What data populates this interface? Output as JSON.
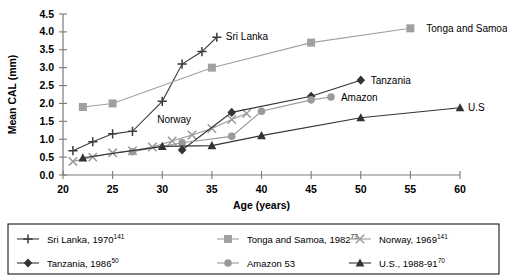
{
  "chart_data": {
    "type": "line",
    "title": "",
    "xlabel": "Age (years)",
    "ylabel": "Mean CAL (mm)",
    "xlim": [
      20,
      60
    ],
    "ylim": [
      0.0,
      4.5
    ],
    "xticks": [
      20,
      25,
      30,
      35,
      40,
      45,
      50,
      55,
      60
    ],
    "yticks": [
      "0.0",
      "0.5",
      "1.0",
      "1.5",
      "2.0",
      "2.5",
      "3.0",
      "3.5",
      "4.0",
      "4.5"
    ],
    "grid": false,
    "legend_position": "bottom",
    "series": [
      {
        "name": "Sri Lanka",
        "legend_label": "Sri Lanka, 1970",
        "legend_superscript": "141",
        "marker": "plus",
        "color": "#3b3b3b",
        "inline_label": "Sri Lanka",
        "inline_label_x": 35.6,
        "inline_label_y": 3.87,
        "points": [
          {
            "x": 21,
            "y": 0.68
          },
          {
            "x": 23,
            "y": 0.93
          },
          {
            "x": 25,
            "y": 1.15
          },
          {
            "x": 27,
            "y": 1.22
          },
          {
            "x": 30,
            "y": 2.06
          },
          {
            "x": 32,
            "y": 3.1
          },
          {
            "x": 34,
            "y": 3.45
          },
          {
            "x": 35.5,
            "y": 3.85
          }
        ]
      },
      {
        "name": "Tonga and Samoa",
        "legend_label": "Tonga and Samoa, 1982",
        "legend_superscript": "73",
        "marker": "square",
        "color": "#a0a0a0",
        "inline_label": "Tonga and Samoa",
        "inline_label_x": 55.8,
        "inline_label_y": 4.1,
        "points": [
          {
            "x": 22,
            "y": 1.9
          },
          {
            "x": 25,
            "y": 2.0
          },
          {
            "x": 35,
            "y": 3.0
          },
          {
            "x": 45,
            "y": 3.7
          },
          {
            "x": 55,
            "y": 4.1
          }
        ]
      },
      {
        "name": "Norway",
        "legend_label": "Norway, 1969",
        "legend_superscript": "141",
        "marker": "cross",
        "color": "#9a9a9a",
        "inline_label": "Norway",
        "inline_label_x": 31.2,
        "inline_label_y": 1.45,
        "points": [
          {
            "x": 21,
            "y": 0.38
          },
          {
            "x": 23,
            "y": 0.5
          },
          {
            "x": 25,
            "y": 0.62
          },
          {
            "x": 27,
            "y": 0.68
          },
          {
            "x": 29,
            "y": 0.78
          },
          {
            "x": 31,
            "y": 0.95
          },
          {
            "x": 33,
            "y": 1.12
          },
          {
            "x": 35,
            "y": 1.3
          },
          {
            "x": 37,
            "y": 1.55
          },
          {
            "x": 38.5,
            "y": 1.72
          }
        ]
      },
      {
        "name": "Tanzania",
        "legend_label": "Tanzania, 1986",
        "legend_superscript": "50",
        "marker": "diamond",
        "color": "#333333",
        "inline_label": "Tanzania",
        "inline_label_x": 50.2,
        "inline_label_y": 2.65,
        "points": [
          {
            "x": 32,
            "y": 0.7
          },
          {
            "x": 37,
            "y": 1.75
          },
          {
            "x": 45,
            "y": 2.2
          },
          {
            "x": 50,
            "y": 2.65
          }
        ]
      },
      {
        "name": "Amazon",
        "legend_label": "Amazon 53",
        "legend_superscript": "",
        "marker": "circle",
        "color": "#9a9a9a",
        "inline_label": "Amazon",
        "inline_label_x": 47.2,
        "inline_label_y": 2.18,
        "points": [
          {
            "x": 27,
            "y": 0.65
          },
          {
            "x": 32,
            "y": 0.9
          },
          {
            "x": 37,
            "y": 1.08
          },
          {
            "x": 40,
            "y": 1.78
          },
          {
            "x": 45,
            "y": 2.1
          },
          {
            "x": 47,
            "y": 2.18
          }
        ]
      },
      {
        "name": "U.S",
        "legend_label": "U.S., 1988-91",
        "legend_superscript": "70",
        "marker": "triangle",
        "color": "#333333",
        "inline_label": "U.S",
        "inline_label_x": 60,
        "inline_label_y": 1.88,
        "points": [
          {
            "x": 22,
            "y": 0.48
          },
          {
            "x": 30,
            "y": 0.8
          },
          {
            "x": 35,
            "y": 0.82
          },
          {
            "x": 40,
            "y": 1.1
          },
          {
            "x": 50,
            "y": 1.6
          },
          {
            "x": 60,
            "y": 1.88
          }
        ]
      }
    ]
  },
  "legend": {
    "rows": [
      [
        {
          "marker": "plus",
          "color": "#3b3b3b",
          "label": "Sri Lanka, 1970",
          "sup": "141"
        },
        {
          "marker": "square",
          "color": "#a0a0a0",
          "label": "Tonga and Samoa, 1982",
          "sup": "73"
        },
        {
          "marker": "cross",
          "color": "#9a9a9a",
          "label": "Norway, 1969",
          "sup": "141"
        }
      ],
      [
        {
          "marker": "diamond",
          "color": "#333333",
          "label": "Tanzania, 1986",
          "sup": "50"
        },
        {
          "marker": "circle",
          "color": "#9a9a9a",
          "label": "Amazon 53",
          "sup": ""
        },
        {
          "marker": "triangle",
          "color": "#333333",
          "label": "U.S., 1988-91",
          "sup": "70"
        }
      ]
    ]
  }
}
